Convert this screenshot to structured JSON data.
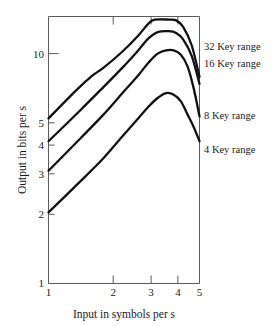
{
  "chart_data": {
    "type": "line",
    "title": "",
    "xlabel": "Input in symbols per s",
    "ylabel": "Output in bits per s",
    "xscale": "log",
    "yscale": "log",
    "xlim": [
      1,
      5
    ],
    "ylim": [
      1,
      13.5
    ],
    "xticks": [
      1,
      2,
      3,
      4,
      5
    ],
    "xticklabels": [
      "1",
      "2",
      "3",
      "4",
      "5"
    ],
    "yticks": [
      1,
      2,
      3,
      4,
      5,
      10
    ],
    "yticklabels": [
      "1",
      "2",
      "3",
      "4",
      "5",
      "10"
    ],
    "grid": false,
    "legend_position": "right-of-axes",
    "series": [
      {
        "name": "32 Key range",
        "label": "32 Key range",
        "x": [
          1.0,
          1.35,
          1.6,
          1.8,
          2.2,
          2.6,
          2.9,
          3.1,
          3.6,
          3.9,
          4.2,
          4.6,
          5.0
        ],
        "y": [
          5.0,
          6.6,
          7.6,
          8.2,
          9.6,
          11.2,
          12.6,
          13.1,
          13.1,
          13.0,
          12.2,
          10.2,
          7.5
        ]
      },
      {
        "name": "16 Key range",
        "label": "16 Key range",
        "x": [
          1.0,
          1.4,
          1.8,
          2.2,
          2.6,
          2.9,
          3.2,
          3.6,
          3.9,
          4.2,
          4.6,
          5.0
        ],
        "y": [
          4.0,
          5.4,
          6.8,
          8.2,
          9.7,
          10.9,
          11.6,
          11.7,
          11.5,
          10.8,
          9.2,
          7.0
        ]
      },
      {
        "name": "8 Key range",
        "label": "8 Key range",
        "x": [
          1.0,
          1.4,
          1.8,
          2.2,
          2.6,
          2.9,
          3.2,
          3.5,
          3.8,
          4.1,
          4.4,
          4.7,
          5.0
        ],
        "y": [
          3.0,
          4.1,
          5.2,
          6.4,
          7.6,
          8.6,
          9.4,
          9.7,
          9.7,
          9.3,
          8.3,
          6.7,
          5.1
        ]
      },
      {
        "name": "4 Key range",
        "label": "4 Key range",
        "x": [
          1.0,
          1.4,
          1.8,
          2.2,
          2.6,
          2.9,
          3.2,
          3.5,
          3.8,
          4.1,
          4.4,
          4.7,
          5.0
        ],
        "y": [
          2.0,
          2.7,
          3.4,
          4.2,
          5.0,
          5.6,
          6.1,
          6.4,
          6.3,
          5.9,
          5.2,
          4.6,
          4.0
        ]
      }
    ]
  },
  "axes": {
    "ylabel": "Output in bits per s",
    "xlabel": "Input in symbols per s",
    "xticklabels": [
      "1",
      "2",
      "3",
      "4",
      "5"
    ],
    "yticklabels": {
      "t1": "1",
      "t2": "2",
      "t3": "3",
      "t4": "4",
      "t5": "5",
      "t10": "10"
    }
  },
  "series_labels": {
    "s32": "32 Key range",
    "s16": "16 Key range",
    "s8": "8 Key range",
    "s4": "4 Key range"
  },
  "colors": {
    "curve": "#111111",
    "axis": "#5a5a5a",
    "text": "#1a1a1a",
    "background": "#ffffff"
  }
}
